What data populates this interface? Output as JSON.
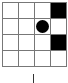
{
  "board": {
    "rows": 4,
    "cols": 4,
    "cells": [
      [
        "empty",
        "empty",
        "empty",
        "filled"
      ],
      [
        "empty",
        "empty",
        "circle",
        "empty"
      ],
      [
        "empty",
        "empty",
        "empty",
        "filled"
      ],
      [
        "empty",
        "empty",
        "empty",
        "empty"
      ]
    ]
  },
  "colors": {
    "filled": "#000000",
    "grid": "#777777",
    "background": "#ffffff"
  },
  "marker": {
    "column_position": "center"
  }
}
